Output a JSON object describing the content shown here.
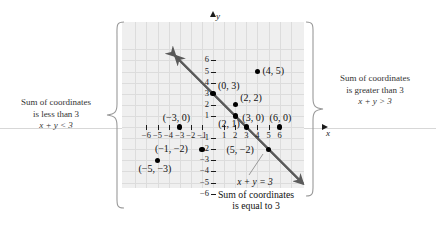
{
  "figure": {
    "axis_labels": {
      "x": "x",
      "y": "y"
    },
    "colors": {
      "plate_background": "#efefef",
      "gridline": "#dcdcdc",
      "axis": "#1b1b1b",
      "point": "#000000",
      "line": "#5a5a5a",
      "note_text": "#333333"
    }
  },
  "chart_data": {
    "type": "scatter",
    "title": "",
    "xlabel": "x",
    "ylabel": "y",
    "xlim": [
      -7,
      7
    ],
    "ylim": [
      -6.8,
      6.8
    ],
    "grid": true,
    "legend": "none",
    "x_ticks": [
      -6,
      -5,
      -4,
      -3,
      -2,
      -1,
      1,
      2,
      3,
      4,
      5,
      6
    ],
    "y_ticks": [
      -6,
      -5,
      -4,
      -3,
      -2,
      -1,
      1,
      2,
      3,
      4,
      5,
      6
    ],
    "x_tick_labels": [
      "-6",
      "-5",
      "-4",
      "-3",
      "-2",
      "-1",
      "1",
      "2",
      "3",
      "4",
      "5",
      "6"
    ],
    "y_tick_labels": [
      "-6",
      "-5",
      "-4",
      "-3",
      "-2",
      "-1",
      "1",
      "2",
      "3",
      "4",
      "5",
      "6"
    ],
    "points": [
      {
        "x": 4,
        "y": 5,
        "label": "(4, 5)",
        "label_side": "right"
      },
      {
        "x": 0,
        "y": 3,
        "label": "(0, 3)",
        "label_side": "right"
      },
      {
        "x": 2,
        "y": 2,
        "label": "(2, 2)",
        "label_side": "right"
      },
      {
        "x": 2,
        "y": 1,
        "label": "(2, 1)",
        "label_side": "below-left"
      },
      {
        "x": -3,
        "y": 0,
        "label": "(-3, 0)",
        "label_side": "above"
      },
      {
        "x": 3,
        "y": 0,
        "label": "(3, 0)",
        "label_side": "above"
      },
      {
        "x": 6,
        "y": 0,
        "label": "(6, 0)",
        "label_side": "above"
      },
      {
        "x": -1,
        "y": -2,
        "label": "(-1, -2)",
        "label_side": "left"
      },
      {
        "x": -5,
        "y": -3,
        "label": "(-5, -3)",
        "label_side": "below-left"
      },
      {
        "x": 5,
        "y": -2,
        "label": "(5, -2)",
        "label_side": "left"
      }
    ],
    "series": [
      {
        "name": "x + y = 3",
        "type": "line",
        "equation": "x + y = 3",
        "slope": -1,
        "intercept": 3,
        "arrows": "both",
        "x_from": -3.4,
        "x_to": 8.1
      }
    ]
  },
  "annotations": {
    "left": {
      "line1": "Sum of coordinates",
      "line2": "is less than 3",
      "equation": "x + y < 3"
    },
    "right": {
      "line1": "Sum of coordinates",
      "line2": "is greater than 3",
      "equation": "x + y > 3"
    },
    "bottom": {
      "equation": "x + y = 3",
      "line1": "Sum of coordinates",
      "line2": "is equal to 3"
    }
  }
}
